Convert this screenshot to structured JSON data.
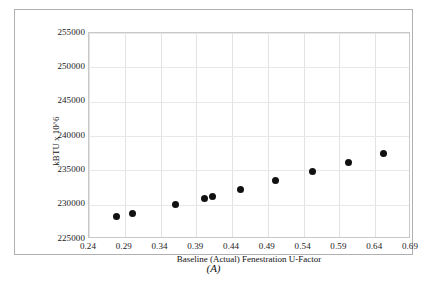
{
  "figure": {
    "caption": "(A)"
  },
  "chart_data": {
    "type": "scatter",
    "title": "",
    "xlabel": "Baseline (Actual)  Fenestration U-Factor",
    "ylabel": "kBTU x 10^6",
    "xlim": [
      0.24,
      0.69
    ],
    "ylim": [
      225000,
      255000
    ],
    "grid": true,
    "legend": null,
    "xticks": [
      "0.24",
      "0.29",
      "0.34",
      "0.39",
      "0.44",
      "0.49",
      "0.54",
      "0.59",
      "0.64",
      "0.69"
    ],
    "xtick_values": [
      0.24,
      0.29,
      0.34,
      0.39,
      0.44,
      0.49,
      0.54,
      0.59,
      0.64,
      0.69
    ],
    "yticks": [
      "225000",
      "230000",
      "235000",
      "240000",
      "245000",
      "250000",
      "255000"
    ],
    "ytick_values": [
      225000,
      230000,
      235000,
      240000,
      245000,
      250000,
      255000
    ],
    "marker": "filled-circle",
    "marker_color": "#111111",
    "points": [
      {
        "x": 0.278,
        "y": 228250
      },
      {
        "x": 0.301,
        "y": 228700
      },
      {
        "x": 0.361,
        "y": 230050
      },
      {
        "x": 0.402,
        "y": 230950
      },
      {
        "x": 0.412,
        "y": 231200
      },
      {
        "x": 0.452,
        "y": 232200
      },
      {
        "x": 0.501,
        "y": 233500
      },
      {
        "x": 0.552,
        "y": 234850
      },
      {
        "x": 0.602,
        "y": 236150
      },
      {
        "x": 0.652,
        "y": 237500
      }
    ],
    "series": [
      {
        "name": "Energy vs U-Factor",
        "x": [
          0.278,
          0.301,
          0.361,
          0.402,
          0.412,
          0.452,
          0.501,
          0.552,
          0.602,
          0.652
        ],
        "values": [
          228250,
          228700,
          230050,
          230950,
          231200,
          232200,
          233500,
          234850,
          236150,
          237500
        ]
      }
    ]
  }
}
